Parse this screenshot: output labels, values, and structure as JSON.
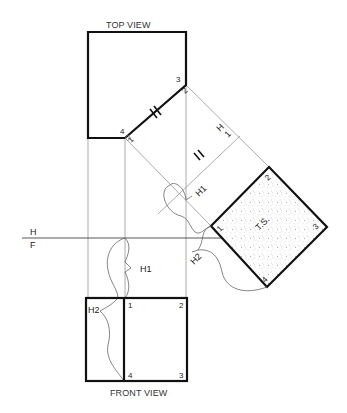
{
  "diagram": {
    "top_view_title": "TOP VIEW",
    "front_view_title": "FRONT VIEW",
    "fold_line_hf": {
      "top": "H",
      "bottom": "F"
    },
    "fold_line_h1": {
      "top": "H",
      "bottom": "1"
    },
    "true_shape_label": "T.S.",
    "top_view_points": {
      "p1": "1",
      "p2": "2",
      "p3": "3",
      "p4": "4"
    },
    "aux_view_points": {
      "p1": "1",
      "p2": "2",
      "p3": "3",
      "p4": "4"
    },
    "front_view_points": {
      "p1": "1",
      "p2": "2",
      "p3": "3",
      "p4": "4"
    },
    "distance_labels": {
      "h1_front": "H1",
      "h2_front": "H2",
      "h1_aux": "H1",
      "h2_aux": "H2"
    },
    "colors": {
      "object_line": "#111111",
      "projection_line": "#888888",
      "stipple": "#9a9a9a"
    }
  }
}
